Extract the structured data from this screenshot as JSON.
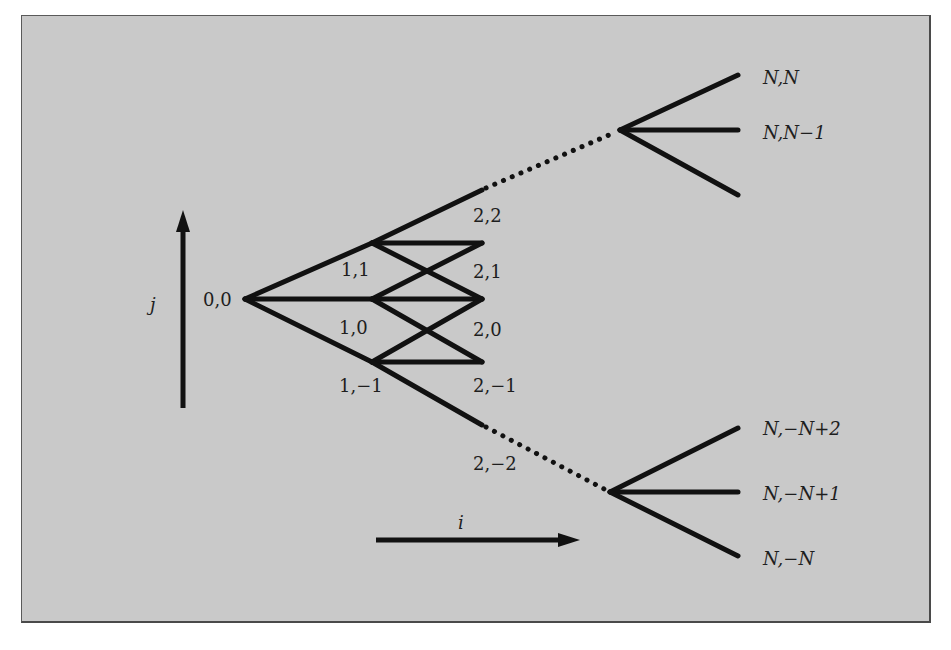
{
  "figure": {
    "background_color": "#c9c9c9",
    "line_color": "#111111",
    "axes": {
      "vertical_label": "j",
      "horizontal_label": "i"
    },
    "nodes": {
      "root": "0,0",
      "level1": [
        "1,1",
        "1,0",
        "1,−1"
      ],
      "level2": [
        "2,2",
        "2,1",
        "2,0",
        "2,−1",
        "2,−2"
      ],
      "levelN_top": [
        "N,N",
        "N,N−1"
      ],
      "levelN_bottom": [
        "N,−N+2",
        "N,−N+1",
        "N,−N"
      ]
    }
  }
}
